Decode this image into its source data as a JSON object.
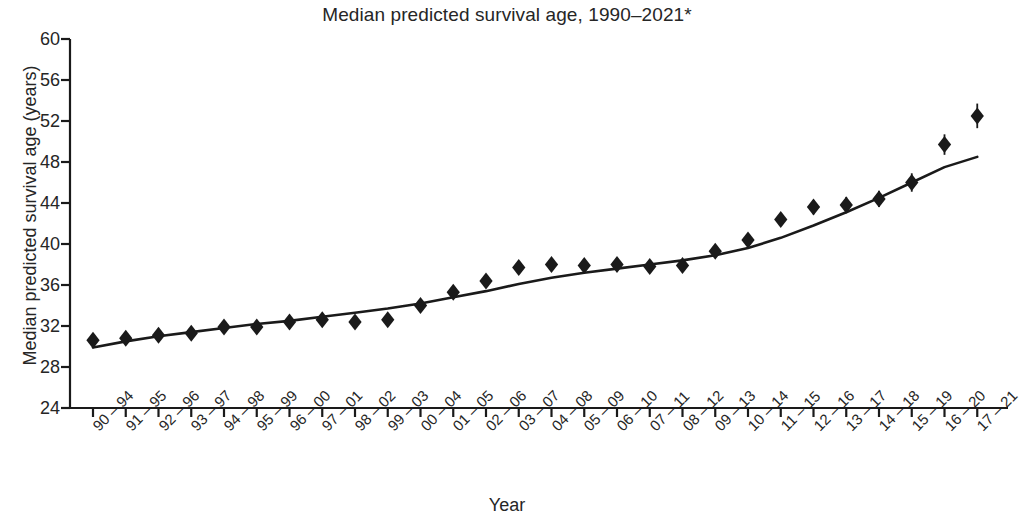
{
  "chart_data": {
    "type": "scatter",
    "title": "Median predicted survival age, 1990–2021*",
    "xlabel": "Year",
    "ylabel": "Median predicted survival age (years)",
    "ylim": [
      24,
      60
    ],
    "yticks": [
      24,
      28,
      32,
      36,
      40,
      44,
      48,
      52,
      56,
      60
    ],
    "grid": false,
    "legend": null,
    "marker": "filled-diamond",
    "error_bars": true,
    "trend_line": true,
    "categories": [
      "90 – 94",
      "91 – 95",
      "92 – 96",
      "93 – 97",
      "94 – 98",
      "95 – 99",
      "96 – 00",
      "97 – 01",
      "98 – 02",
      "99 – 03",
      "00 – 04",
      "01 – 05",
      "02 – 06",
      "03 – 07",
      "04 – 08",
      "05 – 09",
      "06 – 10",
      "07 – 11",
      "08 – 12",
      "09 – 13",
      "10 – 14",
      "11 – 15",
      "12 – 16",
      "13 – 17",
      "14 – 18",
      "15 – 19",
      "16 – 20",
      "17 – 21"
    ],
    "values": [
      30.6,
      30.8,
      31.1,
      31.3,
      31.9,
      31.9,
      32.4,
      32.6,
      32.4,
      32.6,
      34.0,
      35.3,
      36.4,
      37.7,
      38.0,
      37.9,
      38.0,
      37.8,
      37.9,
      39.3,
      40.4,
      42.4,
      43.6,
      43.8,
      44.4,
      46.0,
      49.7,
      52.5
    ],
    "err_low": [
      0.5,
      0.4,
      0.4,
      0.4,
      0.4,
      0.4,
      0.4,
      0.4,
      0.4,
      0.4,
      0.4,
      0.5,
      0.5,
      0.5,
      0.5,
      0.5,
      0.5,
      0.6,
      0.6,
      0.6,
      0.6,
      0.6,
      0.7,
      0.8,
      0.8,
      0.9,
      1.0,
      1.2
    ],
    "err_high": [
      0.5,
      0.4,
      0.4,
      0.4,
      0.4,
      0.4,
      0.4,
      0.4,
      0.4,
      0.4,
      0.4,
      0.5,
      0.5,
      0.5,
      0.5,
      0.5,
      0.5,
      0.6,
      0.6,
      0.6,
      0.6,
      0.6,
      0.7,
      0.8,
      0.8,
      0.9,
      1.0,
      1.2
    ],
    "trend_values": [
      29.9,
      30.5,
      31.0,
      31.4,
      31.8,
      32.2,
      32.5,
      32.9,
      33.3,
      33.7,
      34.2,
      34.8,
      35.4,
      36.1,
      36.7,
      37.2,
      37.6,
      38.0,
      38.4,
      38.9,
      39.6,
      40.6,
      41.8,
      43.1,
      44.5,
      46.0,
      47.5,
      48.5
    ],
    "axis_color": "#1a1a1a",
    "marker_color": "#1a1a1a",
    "line_color": "#1a1a1a"
  }
}
